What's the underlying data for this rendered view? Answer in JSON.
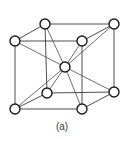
{
  "figure": {
    "caption": "(a)",
    "atom_radius": 5,
    "colors": {
      "line": "#3a3a3a",
      "atom_stroke": "#1a1a1a",
      "atom_fill": "#ffffff",
      "background": "#ffffff"
    }
  },
  "nodes": [
    {
      "id": "front-top-left",
      "x": 15,
      "y": 41
    },
    {
      "id": "front-top-right",
      "x": 82,
      "y": 41
    },
    {
      "id": "front-bottom-left",
      "x": 15,
      "y": 109
    },
    {
      "id": "front-bottom-right",
      "x": 82,
      "y": 109
    },
    {
      "id": "back-top-left",
      "x": 45,
      "y": 24
    },
    {
      "id": "back-top-right",
      "x": 114,
      "y": 24
    },
    {
      "id": "back-bottom-left",
      "x": 47,
      "y": 93
    },
    {
      "id": "back-bottom-right",
      "x": 114,
      "y": 92
    },
    {
      "id": "body-center",
      "x": 65,
      "y": 67
    }
  ],
  "edges": [
    [
      "front-top-left",
      "front-top-right"
    ],
    [
      "front-top-left",
      "front-bottom-left"
    ],
    [
      "front-top-right",
      "front-bottom-right"
    ],
    [
      "front-bottom-left",
      "front-bottom-right"
    ],
    [
      "back-top-left",
      "back-top-right"
    ],
    [
      "back-top-left",
      "back-bottom-left"
    ],
    [
      "back-top-right",
      "back-bottom-right"
    ],
    [
      "back-bottom-left",
      "back-bottom-right"
    ],
    [
      "front-top-left",
      "back-top-left"
    ],
    [
      "front-top-right",
      "back-top-right"
    ],
    [
      "front-bottom-left",
      "back-bottom-left"
    ],
    [
      "front-bottom-right",
      "back-bottom-right"
    ]
  ],
  "diagonals": [
    [
      "body-center",
      "front-top-left"
    ],
    [
      "body-center",
      "front-top-right"
    ],
    [
      "body-center",
      "front-bottom-left"
    ],
    [
      "body-center",
      "front-bottom-right"
    ],
    [
      "body-center",
      "back-top-left"
    ],
    [
      "body-center",
      "back-top-right"
    ],
    [
      "body-center",
      "back-bottom-left"
    ],
    [
      "body-center",
      "back-bottom-right"
    ]
  ]
}
